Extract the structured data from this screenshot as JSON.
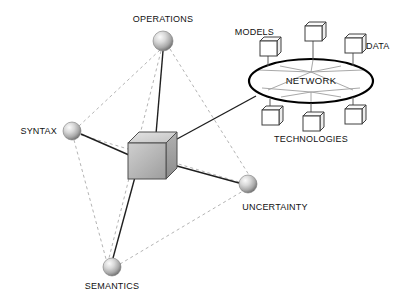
{
  "diagram": {
    "background_color": "#ffffff",
    "colors": {
      "solid_edge": "#1a1a1a",
      "dashed_edge": "#b0b0b0",
      "sphere_light": "#f2f2f2",
      "sphere_mid": "#b8b8b8",
      "sphere_dark": "#6e6e6e",
      "cube_top": "#d4d4d4",
      "cube_front": "#b5b5b5",
      "cube_side": "#9a9a9a",
      "cube_stroke": "#555555",
      "ellipse_stroke": "#000000",
      "spoke": "#9a9a9a",
      "small_cube_stroke": "#4a4a4a",
      "text": "#111111"
    },
    "spheres": [
      {
        "id": "operations",
        "label": "OPERATIONS",
        "cx": 163,
        "cy": 41,
        "r": 10,
        "label_x": 163,
        "label_y": 22,
        "label_anchor": "middle"
      },
      {
        "id": "syntax",
        "label": "SYNTAX",
        "cx": 72,
        "cy": 131,
        "r": 9,
        "label_x": 57,
        "label_y": 131,
        "label_anchor": "end"
      },
      {
        "id": "semantics",
        "label": "SEMANTICS",
        "cx": 112,
        "cy": 267,
        "r": 9,
        "label_x": 112,
        "label_y": 289,
        "label_anchor": "middle"
      },
      {
        "id": "uncertainty",
        "label": "UNCERTAINTY",
        "cx": 248,
        "cy": 184,
        "r": 9,
        "label_x": 248,
        "label_y": 210,
        "label_anchor": "middle"
      }
    ],
    "center_cube": {
      "id": "center-cube",
      "x": 128,
      "y": 143,
      "width": 38,
      "height": 36,
      "depth": 11
    },
    "solid_edges": [
      {
        "from": "center-cube",
        "to": "operations",
        "x1": 155,
        "y1": 146,
        "x2": 163,
        "y2": 51
      },
      {
        "from": "center-cube",
        "to": "syntax",
        "x1": 129,
        "y1": 155,
        "x2": 81,
        "y2": 134
      },
      {
        "from": "center-cube",
        "to": "semantics",
        "x1": 141,
        "y1": 155,
        "x2": 113,
        "y2": 258
      },
      {
        "from": "center-cube",
        "to": "uncertainty",
        "x1": 166,
        "y1": 163,
        "x2": 239,
        "y2": 183
      },
      {
        "from": "center-cube",
        "to": "network",
        "x1": 166,
        "y1": 145,
        "x2": 256,
        "y2": 96
      }
    ],
    "dashed_edges": [
      {
        "from": "operations",
        "to": "syntax",
        "x1": 160,
        "y1": 50,
        "x2": 79,
        "y2": 126
      },
      {
        "from": "operations",
        "to": "semantics",
        "x1": 161,
        "y1": 51,
        "x2": 109,
        "y2": 258
      },
      {
        "from": "operations",
        "to": "uncertainty",
        "x1": 170,
        "y1": 49,
        "x2": 249,
        "y2": 175
      },
      {
        "from": "syntax",
        "to": "semantics",
        "x1": 74,
        "y1": 140,
        "x2": 106,
        "y2": 259
      },
      {
        "from": "syntax",
        "to": "uncertainty",
        "x1": 81,
        "y1": 135,
        "x2": 239,
        "y2": 182
      },
      {
        "from": "semantics",
        "to": "uncertainty",
        "x1": 120,
        "y1": 264,
        "x2": 243,
        "y2": 191
      }
    ],
    "network": {
      "id": "network-cloud",
      "label": "NETWORK",
      "ellipse_cx": 311,
      "ellipse_cy": 81,
      "ellipse_rx": 62,
      "ellipse_ry": 22,
      "label_x": 311,
      "label_y": 84,
      "nodes": [
        {
          "id": "net-node-top",
          "x": 305,
          "y": 26,
          "w": 17,
          "h": 15,
          "stem_x1": 313,
          "stem_y1": 41,
          "stem_x2": 313,
          "stem_y2": 60
        },
        {
          "id": "net-node-upper-left",
          "x": 260,
          "y": 41,
          "w": 17,
          "h": 15,
          "stem_x1": 268,
          "stem_y1": 56,
          "stem_x2": 268,
          "stem_y2": 66
        },
        {
          "id": "net-node-upper-right",
          "x": 345,
          "y": 38,
          "w": 17,
          "h": 15,
          "stem_x1": 353,
          "stem_y1": 53,
          "stem_x2": 353,
          "stem_y2": 66
        },
        {
          "id": "net-node-lower-left",
          "x": 262,
          "y": 110,
          "w": 17,
          "h": 15,
          "stem_x1": 270,
          "stem_y1": 110,
          "stem_x2": 270,
          "stem_y2": 99
        },
        {
          "id": "net-node-bottom",
          "x": 303,
          "y": 116,
          "w": 17,
          "h": 15,
          "stem_x1": 311,
          "stem_y1": 116,
          "stem_x2": 311,
          "stem_y2": 103
        },
        {
          "id": "net-node-lower-right",
          "x": 345,
          "y": 109,
          "w": 17,
          "h": 15,
          "stem_x1": 353,
          "stem_y1": 109,
          "stem_x2": 353,
          "stem_y2": 97
        }
      ],
      "spokes": [
        {
          "x1": 311,
          "y1": 72,
          "x2": 258,
          "y2": 70
        },
        {
          "x1": 311,
          "y1": 72,
          "x2": 280,
          "y2": 66
        },
        {
          "x1": 311,
          "y1": 72,
          "x2": 313,
          "y2": 60
        },
        {
          "x1": 311,
          "y1": 72,
          "x2": 341,
          "y2": 66
        },
        {
          "x1": 311,
          "y1": 72,
          "x2": 363,
          "y2": 70
        },
        {
          "x1": 311,
          "y1": 92,
          "x2": 262,
          "y2": 88
        },
        {
          "x1": 311,
          "y1": 92,
          "x2": 281,
          "y2": 97
        },
        {
          "x1": 311,
          "y1": 92,
          "x2": 311,
          "y2": 103
        },
        {
          "x1": 311,
          "y1": 92,
          "x2": 341,
          "y2": 97
        },
        {
          "x1": 311,
          "y1": 92,
          "x2": 360,
          "y2": 88
        },
        {
          "x1": 311,
          "y1": 72,
          "x2": 353,
          "y2": 90
        },
        {
          "x1": 311,
          "y1": 72,
          "x2": 268,
          "y2": 90
        }
      ],
      "labels": [
        {
          "id": "models-label",
          "text": "MODELS",
          "x": 274,
          "y": 35,
          "anchor": "end"
        },
        {
          "id": "data-label",
          "text": "DATA",
          "x": 366,
          "y": 49,
          "anchor": "start"
        },
        {
          "id": "technologies-label",
          "text": "TECHNOLOGIES",
          "x": 311,
          "y": 142,
          "anchor": "middle"
        }
      ]
    }
  }
}
